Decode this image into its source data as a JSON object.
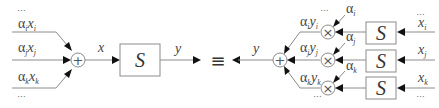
{
  "diagram": {
    "left": {
      "inputs": [
        {
          "coef": "α",
          "coef_sub": "i",
          "var": "x",
          "var_sub": "i"
        },
        {
          "coef": "α",
          "coef_sub": "j",
          "var": "x",
          "var_sub": "j"
        },
        {
          "coef": "α",
          "coef_sub": "k",
          "var": "x",
          "var_sub": "k"
        }
      ],
      "ellipsis_top": "…",
      "ellipsis_bottom": "…",
      "sum_symbol": "+",
      "signal_in": "x",
      "system_label": "S",
      "signal_out": "y"
    },
    "equivalence_symbol": "≡",
    "right": {
      "output_signal": "y",
      "sum_symbol": "+",
      "multiply_symbol": "×",
      "branches": [
        {
          "product_coef": "α",
          "product_coef_sub": "i",
          "product_var": "y",
          "product_var_sub": "i",
          "weight": "α",
          "weight_sub": "i",
          "system_label": "S",
          "input": "x",
          "input_sub": "i"
        },
        {
          "product_coef": "α",
          "product_coef_sub": "j",
          "product_var": "y",
          "product_var_sub": "j",
          "weight": "α",
          "weight_sub": "j",
          "system_label": "S",
          "input": "x",
          "input_sub": "j"
        },
        {
          "product_coef": "α",
          "product_coef_sub": "k",
          "product_var": "y",
          "product_var_sub": "k",
          "weight": "α",
          "weight_sub": "k",
          "system_label": "S",
          "input": "x",
          "input_sub": "k"
        }
      ],
      "ellipsis_top_left": "…",
      "ellipsis_bottom_left": "…",
      "ellipsis_top_right": "…",
      "ellipsis_bottom_right": "…"
    }
  }
}
